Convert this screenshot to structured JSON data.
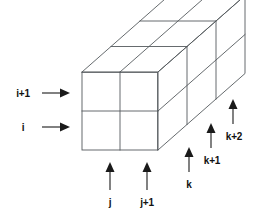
{
  "figure": {
    "line_color": "#555a5e",
    "arrow_color": "#1a1a1a",
    "background": "#ffffff"
  },
  "axes": {
    "i": {
      "name": "i-axis",
      "orientation": "horizontal-right",
      "labels": [
        {
          "text": "i+1",
          "name": "label-i-plus-1"
        },
        {
          "text": "i",
          "name": "label-i"
        }
      ]
    },
    "j": {
      "name": "j-axis",
      "orientation": "vertical-up",
      "labels": [
        {
          "text": "j",
          "name": "label-j"
        },
        {
          "text": "j+1",
          "name": "label-j-plus-1"
        }
      ]
    },
    "k": {
      "name": "k-axis",
      "orientation": "vertical-up-staggered-depth",
      "labels": [
        {
          "text": "k",
          "name": "label-k"
        },
        {
          "text": "k+1",
          "name": "label-k-plus-1"
        },
        {
          "text": "k+2",
          "name": "label-k-plus-2"
        }
      ]
    }
  },
  "grid": {
    "name": "cell-block",
    "columns_j": 2,
    "rows_i": 2,
    "layers_k": 3
  }
}
